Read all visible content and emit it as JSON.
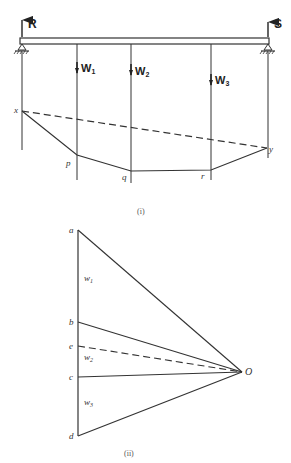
{
  "figure_i": {
    "caption": "(i)",
    "reactions": {
      "left": "R",
      "right": "S"
    },
    "loads": [
      {
        "label": "W",
        "sub": "1"
      },
      {
        "label": "W",
        "sub": "2"
      },
      {
        "label": "W",
        "sub": "3"
      }
    ],
    "points": {
      "x": "x",
      "p": "p",
      "q": "q",
      "r": "r",
      "y": "y"
    }
  },
  "figure_ii": {
    "caption": "(ii)",
    "points": {
      "a": "a",
      "b": "b",
      "e": "e",
      "c": "c",
      "d": "d",
      "O": "O"
    },
    "segments": [
      {
        "label": "w",
        "sub": "1"
      },
      {
        "label": "w",
        "sub": "2"
      },
      {
        "label": "w",
        "sub": "3"
      }
    ]
  },
  "colors": {
    "line": "#333333",
    "background": "#ffffff"
  }
}
